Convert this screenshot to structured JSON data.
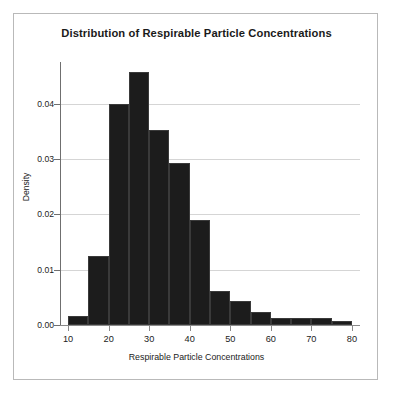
{
  "chart_data": {
    "type": "bar",
    "title": "Distribution of Respirable Particle Concentrations",
    "xlabel": "Respirable Particle Concentrations",
    "ylabel": "Density",
    "xlim": [
      8,
      82
    ],
    "ylim": [
      0.0,
      0.0475
    ],
    "grid": true,
    "legend": "none",
    "bin_width": 5,
    "bin_edges": [
      10,
      15,
      20,
      25,
      30,
      35,
      40,
      45,
      50,
      55,
      60,
      65,
      70,
      75,
      80
    ],
    "categories": [
      "10-15",
      "15-20",
      "20-25",
      "25-30",
      "30-35",
      "35-40",
      "40-45",
      "45-50",
      "50-55",
      "55-60",
      "60-65",
      "65-70",
      "70-75",
      "75-80"
    ],
    "bin_starts": [
      10,
      15,
      20,
      25,
      30,
      35,
      40,
      45,
      50,
      55,
      60,
      65,
      70,
      75
    ],
    "bin_ends": [
      15,
      20,
      25,
      30,
      35,
      40,
      45,
      50,
      55,
      60,
      65,
      70,
      75,
      80
    ],
    "values": [
      0.0017,
      0.0125,
      0.04,
      0.0457,
      0.0352,
      0.0292,
      0.019,
      0.0061,
      0.0043,
      0.0024,
      0.0013,
      0.0013,
      0.0013,
      0.0007
    ],
    "x_ticks": [
      10,
      20,
      30,
      40,
      50,
      60,
      70,
      80
    ],
    "x_tick_labels": [
      "10",
      "20",
      "30",
      "40",
      "50",
      "60",
      "70",
      "80"
    ],
    "y_ticks": [
      0.0,
      0.01,
      0.02,
      0.03,
      0.04
    ],
    "y_tick_labels": [
      "0.00",
      "0.01",
      "0.02",
      "0.03",
      "0.04"
    ],
    "bar_color": "#1c1c1c",
    "gridline_color": "#d5d5d5",
    "axis_color": "#6f6f6f",
    "background_color": "#ffffff",
    "frame_color": "#b9b9b9"
  }
}
